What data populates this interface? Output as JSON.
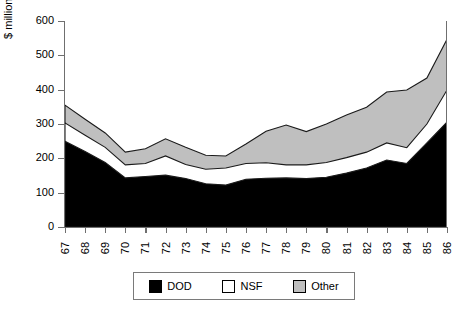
{
  "chart_data": {
    "type": "area",
    "title": "",
    "subtitle": "",
    "xlabel": "",
    "ylabel": "$ millions (constant)",
    "stacked": true,
    "grid": false,
    "legend_position": "bottom",
    "xlim": [
      "67",
      "86"
    ],
    "ylim": [
      0,
      600
    ],
    "ytick_labels": [
      "0",
      "100",
      "200",
      "300",
      "400",
      "500",
      "600"
    ],
    "ytick_values": [
      0,
      100,
      200,
      300,
      400,
      500,
      600
    ],
    "categories": [
      "67",
      "68",
      "69",
      "70",
      "71",
      "72",
      "73",
      "74",
      "75",
      "76",
      "77",
      "78",
      "79",
      "80",
      "81",
      "82",
      "83",
      "84",
      "85",
      "86"
    ],
    "series": [
      {
        "name": "DOD",
        "color": "#000000",
        "values": [
          250,
          220,
          188,
          143,
          147,
          151,
          141,
          126,
          122,
          139,
          142,
          143,
          141,
          145,
          157,
          172,
          195,
          185,
          245,
          306
        ]
      },
      {
        "name": "NSF",
        "color": "#ffffff",
        "values": [
          53,
          47,
          44,
          38,
          38,
          56,
          41,
          42,
          50,
          46,
          45,
          38,
          40,
          43,
          45,
          46,
          50,
          46,
          55,
          93
        ]
      },
      {
        "name": "Other",
        "color": "#bfbfbf",
        "values": [
          52,
          47,
          42,
          37,
          43,
          50,
          50,
          41,
          35,
          57,
          92,
          116,
          97,
          112,
          124,
          131,
          148,
          168,
          134,
          148
        ]
      }
    ],
    "cumulative_tops": {
      "DOD": [
        250,
        220,
        188,
        143,
        147,
        151,
        141,
        126,
        122,
        139,
        142,
        143,
        141,
        145,
        157,
        172,
        195,
        185,
        245,
        306
      ],
      "NSF": [
        303,
        267,
        232,
        181,
        185,
        207,
        182,
        168,
        172,
        185,
        187,
        181,
        181,
        188,
        202,
        218,
        245,
        231,
        300,
        399
      ],
      "Other": [
        355,
        314,
        274,
        218,
        228,
        257,
        232,
        209,
        207,
        242,
        279,
        297,
        278,
        300,
        326,
        349,
        393,
        399,
        434,
        547
      ]
    }
  },
  "legend": {
    "items": [
      {
        "label": "DOD",
        "color": "#000000"
      },
      {
        "label": "NSF",
        "color": "#ffffff"
      },
      {
        "label": "Other",
        "color": "#bfbfbf"
      }
    ]
  },
  "axis": {
    "y_title": "$ millions (constant)"
  }
}
